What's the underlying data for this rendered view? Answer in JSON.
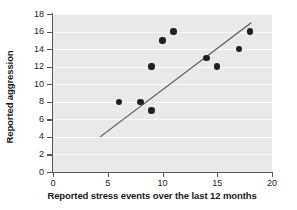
{
  "chart_data": {
    "type": "scatter",
    "title": "",
    "xlabel": "Reported stress events over the last 12 months",
    "ylabel": "Reported aggression",
    "xlim": [
      0,
      20
    ],
    "ylim": [
      0,
      18
    ],
    "xticks": [
      0,
      5,
      10,
      15,
      20
    ],
    "yticks": [
      0,
      2,
      4,
      6,
      8,
      10,
      12,
      14,
      16,
      18
    ],
    "xtick_labels": [
      "0",
      "5",
      "10",
      "15",
      "20"
    ],
    "ytick_labels": [
      "0",
      "2",
      "4",
      "6",
      "8",
      "10",
      "12",
      "14",
      "16",
      "18"
    ],
    "grid": "horizontal",
    "legend": "none",
    "panel_color": "#e9e9e9",
    "gridline_color": "#fbfbfb",
    "marker_color": "#231f20",
    "line_color": "#58585a",
    "points": [
      {
        "x": 6,
        "y": 8
      },
      {
        "x": 8,
        "y": 8
      },
      {
        "x": 9,
        "y": 7
      },
      {
        "x": 9,
        "y": 12
      },
      {
        "x": 10,
        "y": 15
      },
      {
        "x": 11,
        "y": 16
      },
      {
        "x": 14,
        "y": 13
      },
      {
        "x": 15,
        "y": 12
      },
      {
        "x": 17,
        "y": 14
      },
      {
        "x": 18,
        "y": 16
      }
    ],
    "trend_line": {
      "type": "line-of-best-fit",
      "x_start": 4.3,
      "y_start": 4.0,
      "x_end": 18.1,
      "y_end": 17.0
    }
  }
}
